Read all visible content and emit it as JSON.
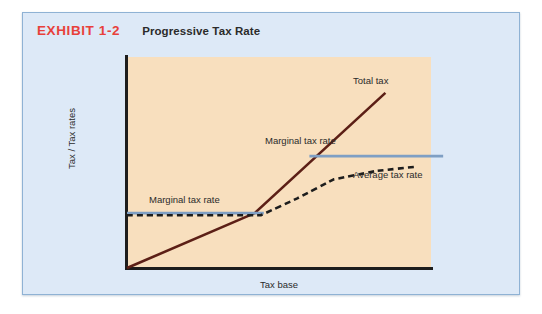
{
  "exhibit": {
    "number": "EXHIBIT 1-2",
    "caption": "Progressive Tax Rate"
  },
  "chart_data": {
    "type": "line",
    "title": "Progressive Tax Rate",
    "xlabel": "Tax base",
    "ylabel": "Tax / Tax rates",
    "grid": false,
    "legend_position": "inline-annotations",
    "axis_ticks": {
      "x": [],
      "y": []
    },
    "xlim": [
      0,
      100
    ],
    "ylim": [
      0,
      100
    ],
    "colors": {
      "total_tax": "#5c1f16",
      "marginal_tax_rate": "#7f9fc4",
      "average_tax_rate": "#1d1d1d",
      "plot_background": "#f8dfbe",
      "panel_background": "#dde9f7",
      "panel_border": "#8fb2d4",
      "exhibit_number": "#e8403a",
      "axis": "#1d1d1d"
    },
    "series": [
      {
        "name": "Total tax",
        "style": "solid",
        "color": "#5c1f16",
        "points": [
          [
            0,
            0
          ],
          [
            42,
            26
          ],
          [
            85,
            83
          ]
        ]
      },
      {
        "name": "Marginal tax rate",
        "style": "solid",
        "color": "#7f9fc4",
        "segments": [
          {
            "label_key": "marginal_lower",
            "points": [
              [
                0,
                26
              ],
              [
                45,
                26
              ]
            ]
          },
          {
            "label_key": "marginal_upper",
            "points": [
              [
                60,
                53
              ],
              [
                104,
                53
              ]
            ]
          }
        ]
      },
      {
        "name": "Average tax rate",
        "style": "dashed",
        "color": "#1d1d1d",
        "points": [
          [
            0,
            25
          ],
          [
            44,
            25
          ],
          [
            56,
            33
          ],
          [
            68,
            42
          ],
          [
            82,
            46
          ],
          [
            95,
            48
          ]
        ]
      }
    ],
    "annotations": [
      {
        "key": "total_tax",
        "text": "Total tax"
      },
      {
        "key": "marginal_upper",
        "text": "Marginal tax rate"
      },
      {
        "key": "average",
        "text": "Average tax rate"
      },
      {
        "key": "marginal_lower",
        "text": "Marginal tax rate"
      }
    ]
  }
}
